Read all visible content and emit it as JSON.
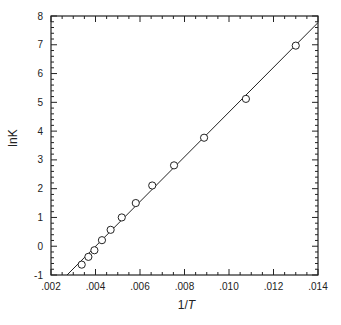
{
  "chart_data": {
    "type": "scatter",
    "title": "",
    "xlabel": "1/T",
    "xlabel_parts": [
      "1/",
      "T"
    ],
    "ylabel": "lnK",
    "xlim": [
      0.002,
      0.014
    ],
    "ylim": [
      -1,
      8
    ],
    "grid": false,
    "legend": null,
    "x_ticks": [
      0.002,
      0.004,
      0.006,
      0.008,
      0.01,
      0.012,
      0.014
    ],
    "x_tick_labels": [
      ".002",
      ".004",
      ".006",
      ".008",
      ".010",
      ".012",
      ".014"
    ],
    "x_minor_step": 0.0005,
    "y_ticks": [
      -1,
      0,
      1,
      2,
      3,
      4,
      5,
      6,
      7,
      8
    ],
    "y_tick_labels": [
      "-1",
      "0",
      "1",
      "2",
      "3",
      "4",
      "5",
      "6",
      "7",
      "8"
    ],
    "y_minor_step": 0.2,
    "series": [
      {
        "name": "data",
        "marker": "open-circle",
        "x": [
          0.00338,
          0.00368,
          0.00395,
          0.00429,
          0.00468,
          0.00518,
          0.00581,
          0.00655,
          0.00753,
          0.00888,
          0.01076,
          0.013
        ],
        "y": [
          -0.64,
          -0.37,
          -0.14,
          0.21,
          0.57,
          1.0,
          1.5,
          2.11,
          2.81,
          3.77,
          5.12,
          6.97
        ]
      }
    ],
    "fit_line": {
      "slope": 777.5,
      "intercept": -3.115,
      "x_range": [
        0.00272,
        0.014
      ]
    }
  },
  "colors": {
    "axis": "#222222",
    "marker_stroke": "#222222",
    "marker_fill": "#ffffff",
    "line": "#222222"
  }
}
